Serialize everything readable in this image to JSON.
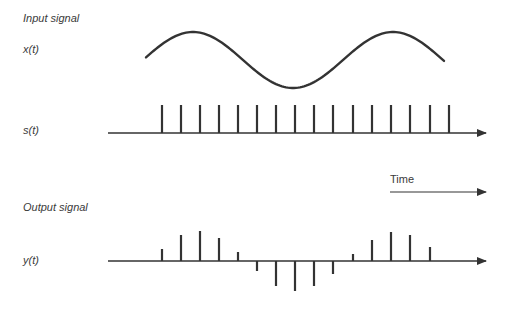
{
  "labels": {
    "input_title": "Input signal",
    "x_label": "x(t)",
    "s_label": "s(t)",
    "time_label": "Time",
    "output_title": "Output signal",
    "y_label": "y(t)"
  },
  "colors": {
    "stroke": "#333333",
    "background": "#ffffff"
  },
  "diagram": {
    "input_curve": {
      "type": "sine",
      "x_start": 146,
      "x_end": 444,
      "peaks_x": [
        193,
        393
      ],
      "trough_x": 293,
      "peak_y": 32,
      "trough_y": 88
    },
    "sampling_train": {
      "axis_y": 133,
      "axis_x_start": 108,
      "axis_x_end": 486,
      "impulse_top_y": 105,
      "impulse_x": [
        162,
        181,
        200,
        219,
        238,
        257,
        276,
        295,
        314,
        333,
        353,
        372,
        391,
        410,
        430,
        449
      ]
    },
    "time_arrow": {
      "x_start": 390,
      "x_end": 486,
      "y": 192
    },
    "output": {
      "axis_y": 261,
      "axis_x_start": 108,
      "axis_x_end": 486,
      "impulse_x": [
        162,
        181,
        200,
        219,
        238,
        257,
        276,
        295,
        314,
        333,
        353,
        372,
        391,
        410,
        430
      ],
      "impulse_heights": [
        12,
        26,
        30,
        23,
        9,
        -10,
        -25,
        -30,
        -25,
        -13,
        7,
        21,
        29,
        26,
        14
      ]
    }
  }
}
